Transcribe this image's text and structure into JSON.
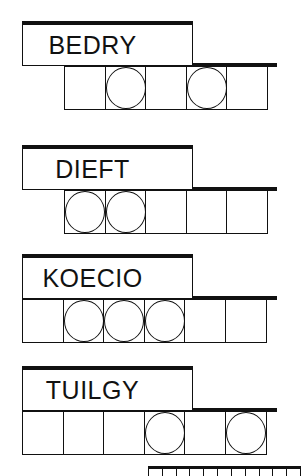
{
  "puzzles": [
    {
      "scrambled": "BEDRY",
      "letter_count": 5,
      "circled_positions": [
        2,
        4
      ]
    },
    {
      "scrambled": "DIEFT",
      "letter_count": 5,
      "circled_positions": [
        1,
        2
      ]
    },
    {
      "scrambled": "KOECIO",
      "letter_count": 6,
      "circled_positions": [
        2,
        3,
        4
      ]
    },
    {
      "scrambled": "TUILGY",
      "letter_count": 6,
      "circled_positions": [
        4,
        6
      ]
    }
  ],
  "answer_strip": {
    "visible_tick_count": 11
  }
}
